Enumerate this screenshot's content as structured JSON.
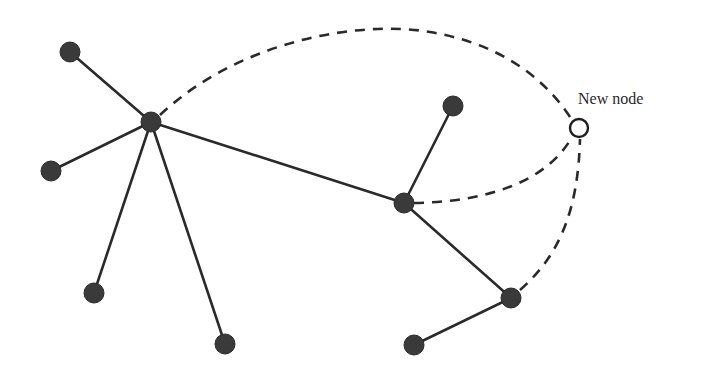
{
  "diagram": {
    "type": "network-graph",
    "new_node_label": "New node",
    "colors": {
      "node_fill": "#3a3a3a",
      "edge": "#2a2a2a",
      "new_node_fill": "#ffffff"
    },
    "nodes": [
      {
        "id": "hub-left",
        "x": 151,
        "y": 122
      },
      {
        "id": "leaf-top-left",
        "x": 70,
        "y": 52
      },
      {
        "id": "leaf-left",
        "x": 51,
        "y": 171
      },
      {
        "id": "leaf-bottom-left",
        "x": 94,
        "y": 293
      },
      {
        "id": "leaf-bottom-mid",
        "x": 225,
        "y": 344
      },
      {
        "id": "hub-right",
        "x": 404,
        "y": 203
      },
      {
        "id": "leaf-top-right",
        "x": 453,
        "y": 106
      },
      {
        "id": "hub-lower-right",
        "x": 511,
        "y": 298
      },
      {
        "id": "leaf-bottom-right",
        "x": 414,
        "y": 345
      },
      {
        "id": "new-node",
        "x": 579,
        "y": 128,
        "new": true
      }
    ],
    "solid_edges": [
      [
        "hub-left",
        "leaf-top-left"
      ],
      [
        "hub-left",
        "leaf-left"
      ],
      [
        "hub-left",
        "leaf-bottom-left"
      ],
      [
        "hub-left",
        "leaf-bottom-mid"
      ],
      [
        "hub-left",
        "hub-right"
      ],
      [
        "hub-right",
        "leaf-top-right"
      ],
      [
        "hub-right",
        "hub-lower-right"
      ],
      [
        "hub-lower-right",
        "leaf-bottom-right"
      ]
    ],
    "dashed_edges": [
      [
        "hub-left",
        "new-node"
      ],
      [
        "hub-right",
        "new-node"
      ],
      [
        "hub-lower-right",
        "new-node"
      ]
    ]
  }
}
